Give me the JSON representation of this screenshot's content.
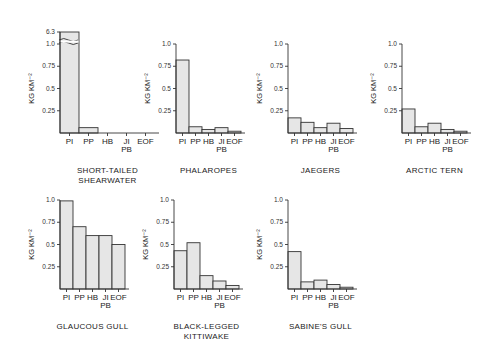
{
  "chart_data": [
    {
      "type": "bar",
      "title": [
        "SHORT-TAILED",
        "SHEARWATER"
      ],
      "categories": [
        "PI",
        "PP",
        "HB",
        "JI/PB",
        "EOF"
      ],
      "category_labels": [
        [
          "PI"
        ],
        [
          "PP"
        ],
        [
          "HB"
        ],
        [
          "JI",
          "PB"
        ],
        [
          "EOF"
        ]
      ],
      "values": [
        6.3,
        0.06,
        0.0,
        0.0,
        0.0
      ],
      "ylabel": "KG KM⁻²",
      "ylim": [
        0,
        1.0
      ],
      "yticks": [
        "0.25",
        "0.5",
        "0.75",
        "1.0"
      ],
      "axis_break": true,
      "break_tick_label": "6.3"
    },
    {
      "type": "bar",
      "title": [
        "PHALAROPES"
      ],
      "categories": [
        "PI",
        "PP",
        "HB",
        "JI/PB",
        "EOF"
      ],
      "category_labels": [
        [
          "PI"
        ],
        [
          "PP"
        ],
        [
          "HB"
        ],
        [
          "JI",
          "PB"
        ],
        [
          "EOF"
        ]
      ],
      "values": [
        0.82,
        0.07,
        0.04,
        0.06,
        0.02
      ],
      "ylabel": "KG KM⁻²",
      "ylim": [
        0,
        1.0
      ],
      "yticks": [
        "0.25",
        "0.5",
        "0.75",
        "1.0"
      ]
    },
    {
      "type": "bar",
      "title": [
        "JAEGERS"
      ],
      "categories": [
        "PI",
        "PP",
        "HB",
        "JI/PB",
        "EOF"
      ],
      "category_labels": [
        [
          "PI"
        ],
        [
          "PP"
        ],
        [
          "HB"
        ],
        [
          "JI",
          "PB"
        ],
        [
          "EOF"
        ]
      ],
      "values": [
        0.17,
        0.12,
        0.06,
        0.11,
        0.05
      ],
      "ylabel": "KG KM⁻²",
      "ylim": [
        0,
        1.0
      ],
      "yticks": [
        "0.25",
        "0.5",
        "0.75",
        "1.0"
      ]
    },
    {
      "type": "bar",
      "title": [
        "ARCTIC TERN"
      ],
      "categories": [
        "PI",
        "PP",
        "HB",
        "JI/PB",
        "EOF"
      ],
      "category_labels": [
        [
          "PI"
        ],
        [
          "PP"
        ],
        [
          "HB"
        ],
        [
          "JI",
          "PB"
        ],
        [
          "EOF"
        ]
      ],
      "values": [
        0.27,
        0.07,
        0.11,
        0.04,
        0.02
      ],
      "ylabel": "KG KM⁻²",
      "ylim": [
        0,
        1.0
      ],
      "yticks": [
        "0.25",
        "0.5",
        "0.75",
        "1.0"
      ]
    },
    {
      "type": "bar",
      "title": [
        "GLAUCOUS GULL"
      ],
      "categories": [
        "PI",
        "PP",
        "HB",
        "JI/PB",
        "EOF"
      ],
      "category_labels": [
        [
          "PI"
        ],
        [
          "PP"
        ],
        [
          "HB"
        ],
        [
          "JI",
          "PB"
        ],
        [
          "EOF"
        ]
      ],
      "values": [
        0.99,
        0.7,
        0.6,
        0.6,
        0.5
      ],
      "ylabel": "KG KM⁻²",
      "ylim": [
        0,
        1.0
      ],
      "yticks": [
        "0.25",
        "0.5",
        "0.75",
        "1.0"
      ]
    },
    {
      "type": "bar",
      "title": [
        "BLACK-LEGGED",
        "KITTIWAKE"
      ],
      "categories": [
        "PI",
        "PP",
        "HB",
        "JI/PB",
        "EOF"
      ],
      "category_labels": [
        [
          "PI"
        ],
        [
          "PP"
        ],
        [
          "HB"
        ],
        [
          "JI",
          "PB"
        ],
        [
          "EOF"
        ]
      ],
      "values": [
        0.43,
        0.52,
        0.15,
        0.09,
        0.04
      ],
      "ylabel": "KG KM⁻²",
      "ylim": [
        0,
        1.0
      ],
      "yticks": [
        "0.25",
        "0.5",
        "0.75",
        "1.0"
      ]
    },
    {
      "type": "bar",
      "title": [
        "SABINE'S GULL"
      ],
      "categories": [
        "PI",
        "PP",
        "HB",
        "JI/PB",
        "EOF"
      ],
      "category_labels": [
        [
          "PI"
        ],
        [
          "PP"
        ],
        [
          "HB"
        ],
        [
          "JI",
          "PB"
        ],
        [
          "EOF"
        ]
      ],
      "values": [
        0.42,
        0.08,
        0.1,
        0.05,
        0.02
      ],
      "ylabel": "KG KM⁻²",
      "ylim": [
        0,
        1.0
      ],
      "yticks": [
        "0.25",
        "0.5",
        "0.75",
        "1.0"
      ]
    }
  ]
}
